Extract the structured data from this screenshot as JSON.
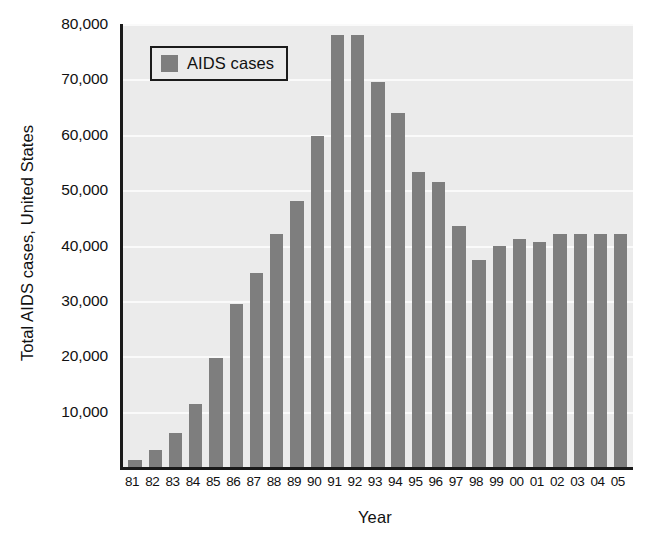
{
  "chart_data": {
    "type": "bar",
    "title": "",
    "xlabel": "Year",
    "ylabel": "Total AIDS cases, United States",
    "legend": [
      {
        "label": "AIDS cases",
        "color": "#7e7e7e"
      }
    ],
    "legend_position": "top-left-inside",
    "grid": true,
    "ylim": [
      0,
      80000
    ],
    "ytick_labels": [
      "80,000",
      "70,000",
      "60,000",
      "50,000",
      "40,000",
      "30,000",
      "20,000",
      "10,000"
    ],
    "ytick_values": [
      80000,
      70000,
      60000,
      50000,
      40000,
      30000,
      20000,
      10000
    ],
    "categories": [
      "81",
      "82",
      "83",
      "84",
      "85",
      "86",
      "87",
      "88",
      "89",
      "90",
      "91",
      "92",
      "93",
      "94",
      "95",
      "96",
      "97",
      "98",
      "99",
      "00",
      "01",
      "02",
      "03",
      "04",
      "05"
    ],
    "values": [
      1200,
      3000,
      6100,
      11300,
      19600,
      29500,
      35000,
      42000,
      48000,
      59800,
      78000,
      78000,
      69500,
      64000,
      53200,
      51500,
      43500,
      37400,
      40000,
      41200,
      40700,
      42100,
      42100,
      42100,
      42100
    ],
    "series": [
      {
        "name": "AIDS cases",
        "color": "#7e7e7e",
        "values": [
          1200,
          3000,
          6100,
          11300,
          19600,
          29500,
          35000,
          42000,
          48000,
          59800,
          78000,
          78000,
          69500,
          64000,
          53200,
          51500,
          43500,
          37400,
          40000,
          41200,
          40700,
          42100,
          42100,
          42100,
          42100
        ]
      }
    ],
    "colors": {
      "bar": "#7e7e7e",
      "plot_background": "#ebebeb",
      "gridline": "#fafafa",
      "axis": "#1a1a1a",
      "page_background": "#ffffff",
      "text": "#111111"
    }
  }
}
